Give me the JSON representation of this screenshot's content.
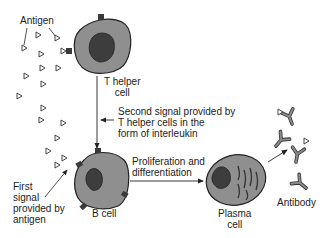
{
  "diagram": {
    "labels": {
      "antigen": "Antigen",
      "t_helper_line1": "T helper",
      "t_helper_line2": "cell",
      "second_signal_line1": "Second signal provided by",
      "second_signal_line2": "T helper cells in the",
      "second_signal_line3": "form of interleukin",
      "first_signal_line1": "First",
      "first_signal_line2": "signal",
      "first_signal_line3": "provided by",
      "first_signal_line4": "antigen",
      "b_cell": "B cell",
      "prolif_line1": "Proliferation and",
      "prolif_line2": "differentiation",
      "plasma_line1": "Plasma",
      "plasma_line2": "cell",
      "antibody": "Antibody"
    },
    "nodes": [
      "Antigen",
      "T helper cell",
      "B cell",
      "Plasma cell",
      "Antibody"
    ],
    "edges": [
      {
        "from": "T helper cell",
        "to": "B cell",
        "label": "Second signal provided by T helper cells in the form of interleukin"
      },
      {
        "from": "Antigen",
        "to": "B cell",
        "label": "First signal provided by antigen"
      },
      {
        "from": "B cell",
        "to": "Plasma cell",
        "label": "Proliferation and differentiation"
      },
      {
        "from": "Plasma cell",
        "to": "Antibody",
        "label": ""
      }
    ],
    "colors": {
      "cell_body": "#8f8f8f",
      "nucleus": "#3d3d3d",
      "outline": "#222222",
      "antibody": "#7a7a7a"
    }
  }
}
